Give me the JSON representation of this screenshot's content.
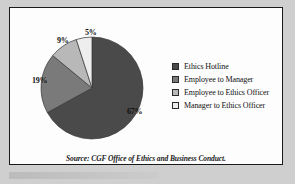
{
  "figure": {
    "source_note": "Source: CGF Office of Ethics and Business Conduct."
  },
  "colors": {
    "slice_1": "#4a4a4a",
    "slice_2": "#7a7a7a",
    "slice_3": "#b8b8b8",
    "slice_4": "#eeeeee",
    "frame_border": "#1a1a1a",
    "figure_background": "#fdfdfd",
    "page_background": "#cfcfcf",
    "text": "#111111"
  },
  "labels": {
    "pct_67": "67%",
    "pct_19": "19%",
    "pct_9": "9%",
    "pct_5": "5%"
  },
  "legend": {
    "items": [
      {
        "label": "Ethics Hotline",
        "color": "#4a4a4a"
      },
      {
        "label": "Employee to Manager",
        "color": "#7a7a7a"
      },
      {
        "label": "Employee to Ethics Officer",
        "color": "#b8b8b8"
      },
      {
        "label": "Manager to Ethics Officer",
        "color": "#eeeeee"
      }
    ]
  },
  "chart_data": {
    "type": "pie",
    "title": "",
    "subtitle": "",
    "xlabel": "",
    "ylabel": "",
    "legend_position": "right",
    "grid": false,
    "start_angle_deg": 0,
    "direction": "clockwise",
    "categories": [
      "Ethics Hotline",
      "Employee to Manager",
      "Employee to Ethics Officer",
      "Manager to Ethics Officer"
    ],
    "values": [
      67,
      19,
      9,
      5
    ],
    "value_labels": [
      "67%",
      "19%",
      "9%",
      "5%"
    ],
    "units": "percent",
    "colors": [
      "#4a4a4a",
      "#7a7a7a",
      "#b8b8b8",
      "#eeeeee"
    ],
    "annotations": [
      "Source: CGF Office of Ethics and Business Conduct."
    ]
  }
}
